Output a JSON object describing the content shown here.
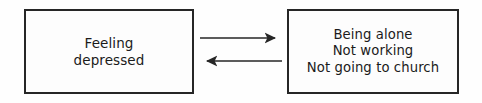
{
  "diagram": {
    "type": "two-node-bidirectional-cycle",
    "background_color": "#fefefe",
    "line_color": "#262626",
    "text_color": "#1b1b1b",
    "nodes": [
      {
        "id": "left",
        "name": "feeling-depressed",
        "text": "Feeling\ndepressed",
        "lines": [
          "Feeling",
          "depressed"
        ],
        "x": 24,
        "y": 9,
        "width": 170,
        "height": 85
      },
      {
        "id": "right",
        "name": "avoidance-behaviors",
        "text": "Being alone\nNot working\nNot going to church",
        "lines": [
          "Being alone",
          "Not working",
          "Not going to church"
        ],
        "x": 287,
        "y": 9,
        "width": 172,
        "height": 85
      }
    ],
    "connectors": [
      {
        "id": "forward",
        "name": "arrow-left-to-right",
        "direction": "right",
        "from": "left",
        "to": "right",
        "x1": 200,
        "y1": 38,
        "x2": 282,
        "y2": 38
      },
      {
        "id": "backward",
        "name": "arrow-right-to-left",
        "direction": "left",
        "from": "right",
        "to": "left",
        "x1": 282,
        "y1": 61,
        "x2": 200,
        "y2": 61
      }
    ]
  }
}
